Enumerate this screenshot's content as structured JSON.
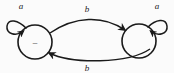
{
  "diagram": {
    "type": "finite-state-automaton",
    "background_color": "#fbfbfb",
    "stroke_color": "#1a1a1a",
    "nodes": [
      {
        "id": "left",
        "label": "–",
        "cx": 35,
        "cy": 42,
        "r": 17
      },
      {
        "id": "right",
        "label": "",
        "cx": 139,
        "cy": 41,
        "r": 17
      }
    ],
    "edges": [
      {
        "id": "left-self-loop",
        "label": "a",
        "from": "left",
        "to": "left",
        "kind": "self-loop",
        "label_x": 21,
        "label_y": 9
      },
      {
        "id": "top-arc",
        "label": "b",
        "from": "left",
        "to": "right",
        "kind": "arc",
        "direction": "left-to-right",
        "label_x": 87,
        "label_y": 12
      },
      {
        "id": "bottom-arc",
        "label": "b",
        "from": "right",
        "to": "left",
        "kind": "arc",
        "direction": "right-to-left",
        "label_x": 87,
        "label_y": 71
      },
      {
        "id": "right-self-loop",
        "label": "a",
        "from": "right",
        "to": "right",
        "kind": "self-loop",
        "label_x": 157,
        "label_y": 9
      }
    ]
  }
}
